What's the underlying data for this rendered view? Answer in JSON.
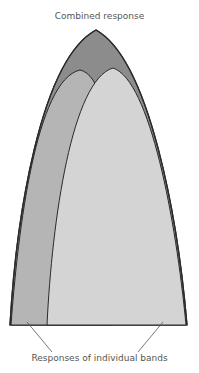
{
  "labels": {
    "combined": "Combined response",
    "individual": "Responses of individual bands"
  },
  "colors": {
    "combined_fill": "#8c8c8c",
    "left_band_fill": "#b5b5b5",
    "right_band_fill": "#d4d4d4",
    "outline": "#2a2a2a",
    "leader_line": "#555555",
    "text": "#555555"
  }
}
